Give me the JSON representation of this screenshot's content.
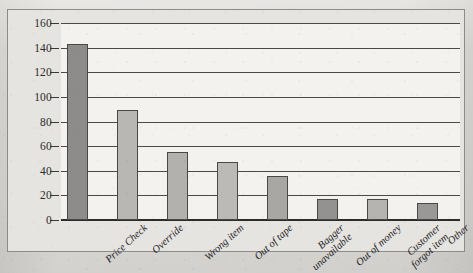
{
  "chart_data": {
    "type": "bar",
    "title": "",
    "xlabel": "",
    "ylabel": "",
    "ylim": [
      0,
      160
    ],
    "grid": true,
    "legend": "none",
    "categories": [
      "Price Check",
      "Override",
      "Wrong item",
      "Out of tape",
      "Bagger unavailable",
      "Out of money",
      "Customer forgot item",
      "Other"
    ],
    "category_lines": [
      [
        "Price Check"
      ],
      [
        "Override"
      ],
      [
        "Wrong item"
      ],
      [
        "Out of tape"
      ],
      [
        "Bagger",
        "unavailable"
      ],
      [
        "Out of money"
      ],
      [
        "Customer",
        "forgot item"
      ],
      [
        "Other"
      ]
    ],
    "values": [
      143,
      89,
      55,
      47,
      36,
      17,
      17,
      14
    ],
    "bar_colors": [
      "#8e8c8a",
      "#b9b7b4",
      "#b3b1ae",
      "#bcbab7",
      "#a9a7a4",
      "#949290",
      "#b6b4b1",
      "#9a9896"
    ],
    "yticks": [
      0,
      20,
      40,
      60,
      80,
      100,
      120,
      140,
      160
    ],
    "ytick_labels": [
      "0",
      "20",
      "40",
      "60",
      "80",
      "100",
      "120",
      "140",
      "160"
    ]
  },
  "colors": {
    "page_background": "#d9d7d3",
    "frame_background": "#e6e4e0",
    "plot_background": "#f3f2ef",
    "gridline": "#4c4a48",
    "axis": "#2e2c2b",
    "text": "#23211f"
  },
  "caption": {
    "text": ""
  }
}
